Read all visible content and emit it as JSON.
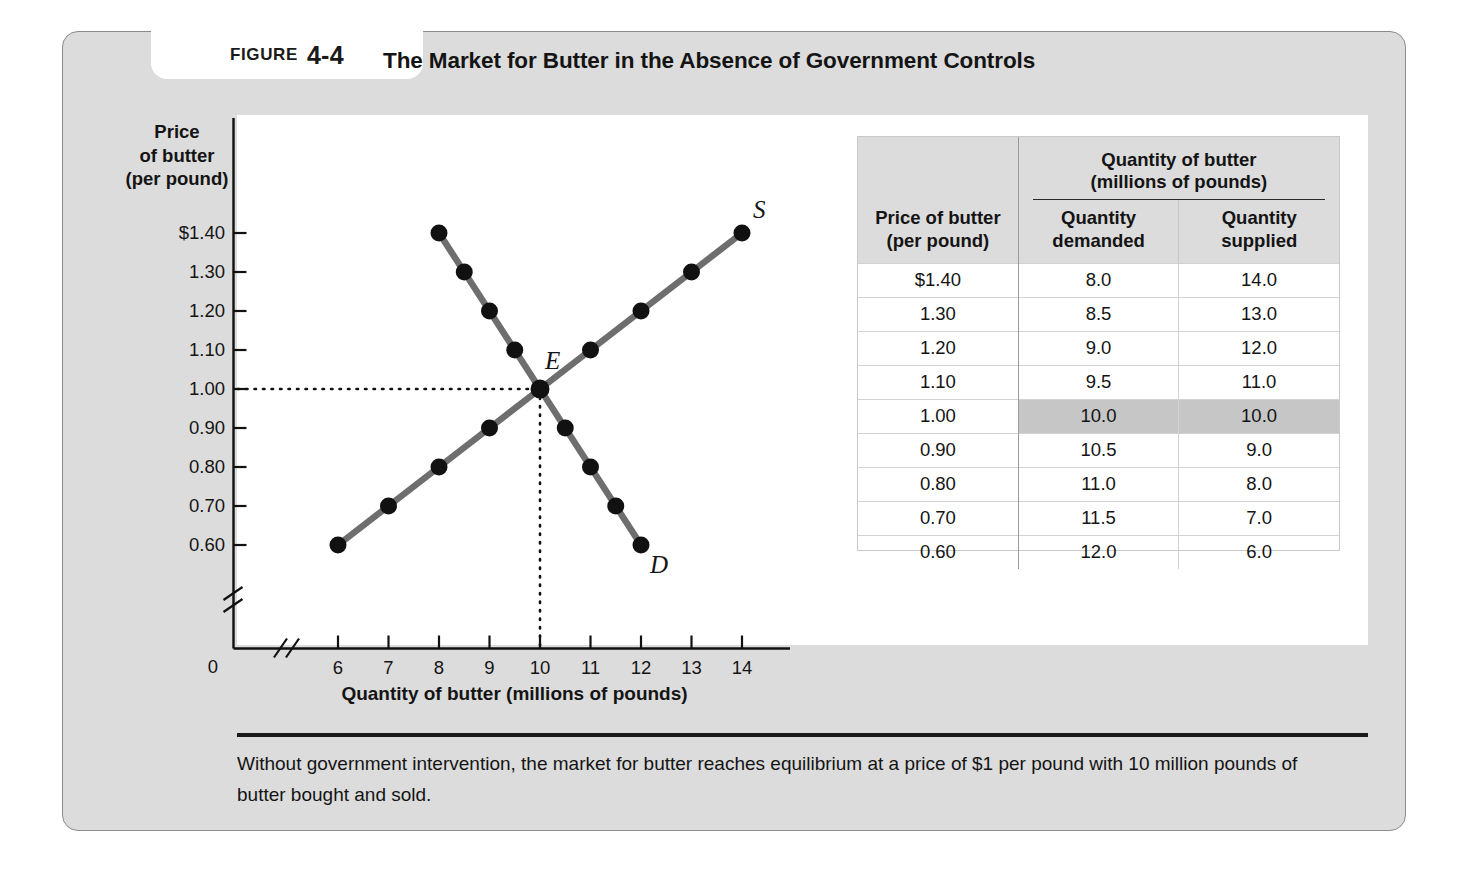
{
  "figure": {
    "tag_word": "FIGURE",
    "tag_number": "4-4",
    "title": "The Market for Butter in the Absence of Government Controls",
    "caption": "Without government intervention, the market for butter reaches equilibrium at a price of $1 per pound with 10 million pounds of butter bought and sold."
  },
  "table": {
    "price_header_line1": "Price of butter",
    "price_header_line2": "(per pound)",
    "quantity_group_line1": "Quantity of butter",
    "quantity_group_line2": "(millions of pounds)",
    "demanded_line1": "Quantity",
    "demanded_line2": "demanded",
    "supplied_line1": "Quantity",
    "supplied_line2": "supplied",
    "highlight_color": "#c6c6c6",
    "rows": [
      {
        "price": "$1.40",
        "demanded": "8.0",
        "supplied": "14.0",
        "highlight": false
      },
      {
        "price": "1.30",
        "demanded": "8.5",
        "supplied": "13.0",
        "highlight": false
      },
      {
        "price": "1.20",
        "demanded": "9.0",
        "supplied": "12.0",
        "highlight": false
      },
      {
        "price": "1.10",
        "demanded": "9.5",
        "supplied": "11.0",
        "highlight": false
      },
      {
        "price": "1.00",
        "demanded": "10.0",
        "supplied": "10.0",
        "highlight": true
      },
      {
        "price": "0.90",
        "demanded": "10.5",
        "supplied": "9.0",
        "highlight": false
      },
      {
        "price": "0.80",
        "demanded": "11.0",
        "supplied": "8.0",
        "highlight": false
      },
      {
        "price": "0.70",
        "demanded": "11.5",
        "supplied": "7.0",
        "highlight": false
      },
      {
        "price": "0.60",
        "demanded": "12.0",
        "supplied": "6.0",
        "highlight": false
      }
    ]
  },
  "chart_data": {
    "type": "line",
    "title": "The Market for Butter in the Absence of Government Controls",
    "xlabel": "Quantity of butter (millions of pounds)",
    "ylabel_lines": [
      "Price",
      "of butter",
      "(per pound)"
    ],
    "origin_label": "0",
    "xlim": [
      6,
      14
    ],
    "ylim": [
      0.6,
      1.4
    ],
    "xticks": [
      "6",
      "7",
      "8",
      "9",
      "10",
      "11",
      "12",
      "13",
      "14"
    ],
    "xtick_values": [
      6,
      7,
      8,
      9,
      10,
      11,
      12,
      13,
      14
    ],
    "yticks": [
      "$1.40",
      "1.30",
      "1.20",
      "1.10",
      "1.00",
      "0.90",
      "0.80",
      "0.70",
      "0.60"
    ],
    "ytick_values": [
      1.4,
      1.3,
      1.2,
      1.1,
      1.0,
      0.9,
      0.8,
      0.7,
      0.6
    ],
    "grid": false,
    "axis_break_x": true,
    "axis_break_y": true,
    "legend_position": "inline-curve-labels",
    "curve_color": "#6e6e6e",
    "marker_color": "#111111",
    "series": [
      {
        "name": "S",
        "label": "S",
        "role": "supply",
        "points": [
          {
            "x": 6,
            "y": 0.6
          },
          {
            "x": 7,
            "y": 0.7
          },
          {
            "x": 8,
            "y": 0.8
          },
          {
            "x": 9,
            "y": 0.9
          },
          {
            "x": 10,
            "y": 1.0
          },
          {
            "x": 11,
            "y": 1.1
          },
          {
            "x": 12,
            "y": 1.2
          },
          {
            "x": 13,
            "y": 1.3
          },
          {
            "x": 14,
            "y": 1.4
          }
        ]
      },
      {
        "name": "D",
        "label": "D",
        "role": "demand",
        "points": [
          {
            "x": 8,
            "y": 1.4
          },
          {
            "x": 8.5,
            "y": 1.3
          },
          {
            "x": 9,
            "y": 1.2
          },
          {
            "x": 9.5,
            "y": 1.1
          },
          {
            "x": 10,
            "y": 1.0
          },
          {
            "x": 10.5,
            "y": 0.9
          },
          {
            "x": 11,
            "y": 0.8
          },
          {
            "x": 11.5,
            "y": 0.7
          },
          {
            "x": 12,
            "y": 0.6
          }
        ]
      }
    ],
    "annotations": [
      {
        "label": "E",
        "x": 10,
        "y": 1.0,
        "note": "equilibrium point"
      }
    ],
    "guide_lines": [
      {
        "from": "y-axis",
        "to_x": 10,
        "at_y": 1.0,
        "style": "dotted"
      },
      {
        "from": "x-axis",
        "at_x": 10,
        "to_y": 1.0,
        "style": "dotted"
      }
    ]
  }
}
